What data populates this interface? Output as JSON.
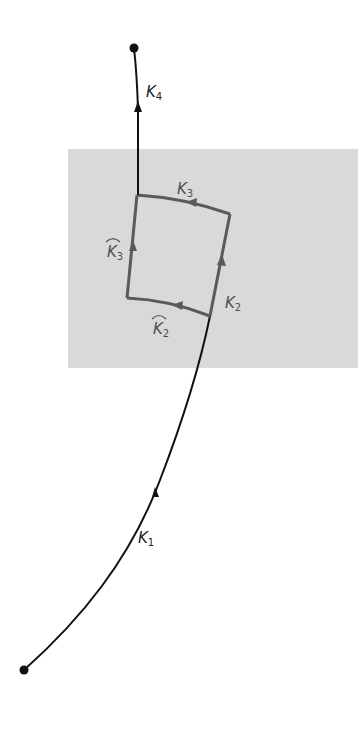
{
  "diagram": {
    "background_region": {
      "color": "#d9d9d9",
      "x": 68,
      "y": 149,
      "width": 290,
      "height": 219
    },
    "colors": {
      "path": "#111111",
      "loop": "#5a5a5a",
      "label_dark": "#222222",
      "label_loop": "#4f4f4f"
    },
    "points": {
      "start": {
        "x": 24,
        "y": 670
      },
      "end": {
        "x": 134,
        "y": 48
      }
    },
    "curves": [
      {
        "id": "K1",
        "label": "K",
        "subscript": "1",
        "hat": false,
        "style": "black",
        "label_pos": {
          "x": 138,
          "y": 543
        }
      },
      {
        "id": "K2",
        "label": "K",
        "subscript": "2",
        "hat": false,
        "style": "loop",
        "label_pos": {
          "x": 225,
          "y": 308
        }
      },
      {
        "id": "K3",
        "label": "K",
        "subscript": "3",
        "hat": false,
        "style": "loop",
        "label_pos": {
          "x": 177,
          "y": 194
        }
      },
      {
        "id": "K4",
        "label": "K",
        "subscript": "4",
        "hat": false,
        "style": "black",
        "label_pos": {
          "x": 146,
          "y": 97
        }
      },
      {
        "id": "K2hat",
        "label": "K",
        "subscript": "2",
        "hat": true,
        "style": "loop",
        "label_pos": {
          "x": 153,
          "y": 334
        }
      },
      {
        "id": "K3hat",
        "label": "K",
        "subscript": "3",
        "hat": true,
        "style": "loop",
        "label_pos": {
          "x": 107,
          "y": 257
        }
      }
    ],
    "loop_corners": {
      "top_left": {
        "x": 137,
        "y": 195
      },
      "top_right": {
        "x": 230,
        "y": 214
      },
      "bottom_right": {
        "x": 210,
        "y": 316
      },
      "bottom_left": {
        "x": 127,
        "y": 298
      }
    }
  }
}
